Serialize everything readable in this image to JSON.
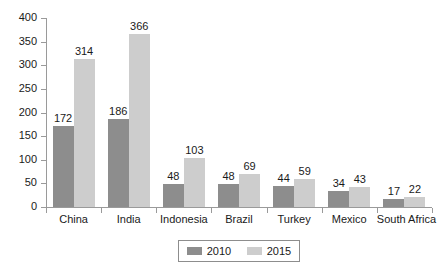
{
  "chart_data": {
    "type": "bar",
    "title": "",
    "subtitle": "",
    "xlabel": "",
    "ylabel": "",
    "categories": [
      "China",
      "India",
      "Indonesia",
      "Brazil",
      "Turkey",
      "Mexico",
      "South Africa"
    ],
    "series": [
      {
        "name": "2010",
        "color": "#8d8d8d",
        "values": [
          172,
          186,
          48,
          48,
          44,
          34,
          17
        ]
      },
      {
        "name": "2015",
        "color": "#cdcdcd",
        "values": [
          314,
          366,
          103,
          69,
          59,
          43,
          22
        ]
      }
    ],
    "ylim": [
      0,
      400
    ],
    "yticks": [
      0,
      50,
      100,
      150,
      200,
      250,
      300,
      350,
      400
    ],
    "ytick_labels": [
      "0",
      "50",
      "100",
      "150",
      "200",
      "250",
      "300",
      "350",
      "400"
    ],
    "grid": false,
    "legend_position": "bottom",
    "data_labels": true,
    "axis_color": "#9a9a9a",
    "text_color": "#1a1a1a",
    "background": "#ffffff"
  },
  "legend": {
    "entries": [
      {
        "label": "2010",
        "color": "#8d8d8d"
      },
      {
        "label": "2015",
        "color": "#cdcdcd"
      }
    ]
  }
}
